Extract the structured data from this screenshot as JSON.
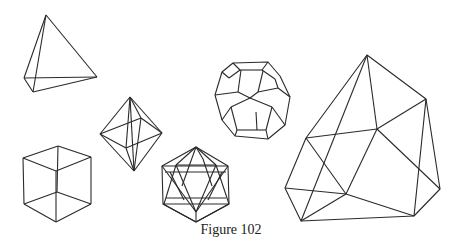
{
  "figure": {
    "caption": "Figure 102",
    "stroke_color": "#2a2a2a",
    "background": "#ffffff",
    "shapes": [
      {
        "name": "tetrahedron",
        "vertices": [
          [
            46,
            15
          ],
          [
            24,
            78
          ],
          [
            33,
            92
          ],
          [
            97,
            77
          ]
        ],
        "edges": [
          [
            0,
            1
          ],
          [
            0,
            2
          ],
          [
            0,
            3
          ],
          [
            1,
            2
          ],
          [
            2,
            3
          ],
          [
            1,
            3
          ]
        ]
      },
      {
        "name": "cube",
        "vertices": [
          [
            58,
            146
          ],
          [
            23,
            158
          ],
          [
            91,
            157
          ],
          [
            56,
            171
          ],
          [
            57,
            192
          ],
          [
            24,
            204
          ],
          [
            91,
            204
          ],
          [
            56,
            222
          ]
        ],
        "edges": [
          [
            0,
            1
          ],
          [
            0,
            2
          ],
          [
            1,
            3
          ],
          [
            2,
            3
          ],
          [
            0,
            4
          ],
          [
            1,
            5
          ],
          [
            2,
            6
          ],
          [
            3,
            7
          ],
          [
            4,
            5
          ],
          [
            4,
            6
          ],
          [
            5,
            7
          ],
          [
            6,
            7
          ]
        ]
      },
      {
        "name": "octahedron",
        "vertices": [
          [
            130,
            97
          ],
          [
            100,
            134
          ],
          [
            162,
            133
          ],
          [
            134,
            171
          ],
          [
            141,
            118
          ],
          [
            126,
            148
          ]
        ],
        "edges": [
          [
            0,
            1
          ],
          [
            0,
            2
          ],
          [
            1,
            3
          ],
          [
            2,
            3
          ],
          [
            0,
            4
          ],
          [
            0,
            5
          ],
          [
            1,
            4
          ],
          [
            2,
            4
          ],
          [
            1,
            5
          ],
          [
            2,
            5
          ],
          [
            3,
            4
          ],
          [
            3,
            5
          ],
          [
            4,
            5
          ]
        ]
      },
      {
        "name": "icosahedron",
        "outline": [
          [
            196,
            147
          ],
          [
            228,
            166
          ],
          [
            229,
            204
          ],
          [
            196,
            222
          ],
          [
            163,
            204
          ],
          [
            162,
            166
          ]
        ]
      },
      {
        "name": "dodecahedron",
        "center": [
          250,
          96
        ]
      },
      {
        "name": "irregular-polyhedron",
        "vertices": [
          [
            367,
            55
          ],
          [
            426,
            99
          ],
          [
            440,
            189
          ],
          [
            414,
            216
          ],
          [
            301,
            221
          ],
          [
            285,
            188
          ],
          [
            306,
            138
          ],
          [
            377,
            129
          ],
          [
            346,
            194
          ]
        ]
      }
    ]
  }
}
